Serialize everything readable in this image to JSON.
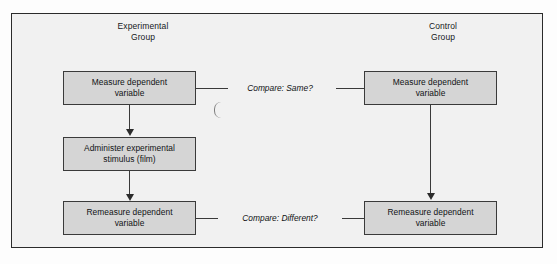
{
  "figure": {
    "columns": {
      "experimental": "Experimental\nGroup",
      "control": "Control\nGroup"
    },
    "nodes": {
      "exp_measure": "Measure dependent\nvariable",
      "exp_stimulus": "Administer experimental\nstimulus (film)",
      "exp_remeasure": "Remeasure dependent\nvariable",
      "ctl_measure": "Measure dependent\nvariable",
      "ctl_remeasure": "Remeasure dependent\nvariable"
    },
    "connectors": {
      "compare_same": "Compare: Same?",
      "compare_different": "Compare: Different?"
    },
    "colors": {
      "node_fill": "#d5d5d5",
      "node_border": "#3a3a3a",
      "canvas_fill": "#f1f1f1",
      "frame_border": "#2b2b2b",
      "text": "#101214"
    }
  }
}
